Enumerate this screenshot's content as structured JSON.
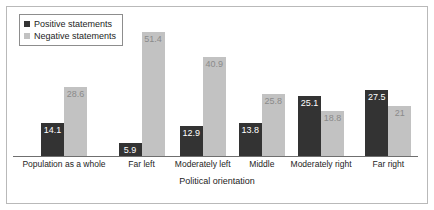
{
  "chart_data": {
    "type": "bar",
    "title": "",
    "xlabel": "Political orientation",
    "ylabel": "",
    "ylim": [
      0,
      55
    ],
    "grid": false,
    "legend_position": "top-left",
    "categories": [
      "Population as a whole",
      "Far left",
      "Moderately left",
      "Middle",
      "Moderately right",
      "Far right"
    ],
    "series": [
      {
        "name": "Positive statements",
        "color": "#333333",
        "values": [
          14.1,
          5.9,
          12.9,
          13.8,
          25.1,
          27.5
        ],
        "labels": [
          "14.1",
          "5.9",
          "12.9",
          "13.8",
          "25.1",
          "27.5"
        ]
      },
      {
        "name": "Negative statements",
        "color": "#c2c2c2",
        "values": [
          28.6,
          51.4,
          40.9,
          25.8,
          18.8,
          21
        ],
        "labels": [
          "28.6",
          "51.4",
          "40.9",
          "25.8",
          "18.8",
          "21"
        ]
      }
    ]
  },
  "legend": {
    "items": [
      {
        "label": "Positive statements",
        "color": "#333333"
      },
      {
        "label": "Negative statements",
        "color": "#c2c2c2"
      }
    ]
  },
  "axis": {
    "x_title": "Political orientation"
  }
}
